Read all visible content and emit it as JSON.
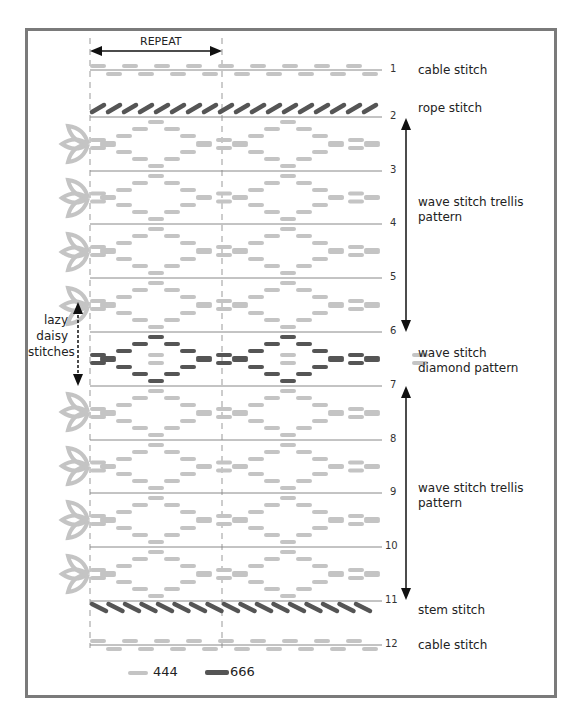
{
  "header": {
    "repeat_label": "REPEAT"
  },
  "colors": {
    "light": "#c4c4c4",
    "dark": "#555555",
    "frame": "#7a7a7a",
    "rule": "#888888"
  },
  "rows": [
    {
      "num": "1",
      "y": 70
    },
    {
      "num": "2",
      "y": 117
    },
    {
      "num": "3",
      "y": 171
    },
    {
      "num": "4",
      "y": 224
    },
    {
      "num": "5",
      "y": 278
    },
    {
      "num": "6",
      "y": 332
    },
    {
      "num": "7",
      "y": 386
    },
    {
      "num": "8",
      "y": 440
    },
    {
      "num": "9",
      "y": 493
    },
    {
      "num": "10",
      "y": 547
    },
    {
      "num": "11",
      "y": 601
    },
    {
      "num": "12",
      "y": 645
    }
  ],
  "labels": {
    "cable_top": "cable stitch",
    "rope": "rope stitch",
    "trellis_top_1": "wave stitch trellis",
    "trellis_top_2": "pattern",
    "diamond_1": "wave stitch",
    "diamond_2": "diamond pattern",
    "trellis_bottom_1": "wave stitch trellis",
    "trellis_bottom_2": "pattern",
    "stem": "stem stitch",
    "cable_bottom": "cable stitch"
  },
  "side_label": {
    "line1": "lazy",
    "line2": "daisy",
    "line3": "stitches"
  },
  "legend": [
    {
      "color": "#c4c4c4",
      "label": "444"
    },
    {
      "color": "#555555",
      "label": "666"
    }
  ]
}
